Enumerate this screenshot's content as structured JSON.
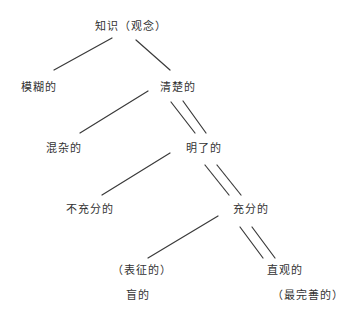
{
  "diagram": {
    "type": "tree",
    "title": "知识（观念）",
    "nodes": [
      {
        "id": "root",
        "label": "知识（观念）",
        "x": 95,
        "y": 21
      },
      {
        "id": "vague",
        "label": "模糊的",
        "x": 21,
        "y": 82
      },
      {
        "id": "clear",
        "label": "清楚的",
        "x": 160,
        "y": 82
      },
      {
        "id": "confused",
        "label": "混杂的",
        "x": 46,
        "y": 143
      },
      {
        "id": "distinct",
        "label": "明了的",
        "x": 186,
        "y": 143
      },
      {
        "id": "inadequate",
        "label": "不充分的",
        "x": 66,
        "y": 204
      },
      {
        "id": "adequate",
        "label": "充分的",
        "x": 233,
        "y": 204
      },
      {
        "id": "symbolic",
        "label": "（表征的）",
        "x": 112,
        "y": 265
      },
      {
        "id": "blind",
        "label": "盲的",
        "x": 126,
        "y": 290
      },
      {
        "id": "intuitive",
        "label": "直观的",
        "x": 267,
        "y": 265
      },
      {
        "id": "most_perfect",
        "label": "（最完善的）",
        "x": 272,
        "y": 290
      }
    ],
    "edges": [
      {
        "from": "root",
        "to": "vague",
        "style": "single"
      },
      {
        "from": "root",
        "to": "clear",
        "style": "single"
      },
      {
        "from": "clear",
        "to": "confused",
        "style": "single"
      },
      {
        "from": "clear",
        "to": "distinct",
        "style": "double"
      },
      {
        "from": "distinct",
        "to": "inadequate",
        "style": "single"
      },
      {
        "from": "distinct",
        "to": "adequate",
        "style": "double"
      },
      {
        "from": "adequate",
        "to": "symbolic",
        "style": "single"
      },
      {
        "from": "adequate",
        "to": "intuitive",
        "style": "double"
      }
    ],
    "colors": {
      "line": "#3a3a3a",
      "text": "#333333",
      "background": "#ffffff"
    }
  }
}
